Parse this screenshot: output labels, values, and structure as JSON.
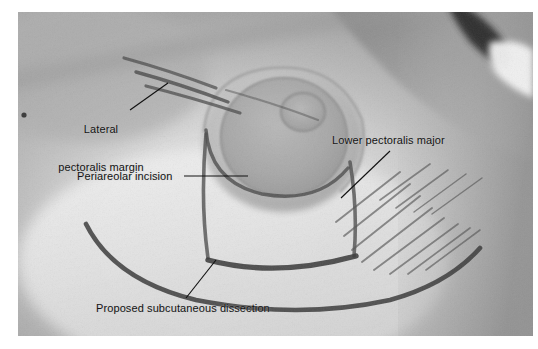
{
  "figure": {
    "type": "clinical-photograph",
    "background_color": "#ffffff",
    "photo": {
      "x": 18,
      "y": 12,
      "width": 515,
      "height": 324,
      "skin_tone": "#b7b7b7",
      "highlight_tone": "#e9e9e9",
      "shadow_tone": "#8a8a8a",
      "marking_color": "#3a3a3a"
    }
  },
  "annotations": [
    {
      "id": "lateral-pectoralis-margin",
      "line1": "Lateral",
      "line2": "pectoralis margin",
      "text": "Lateral pectoralis margin",
      "leader": {
        "x1": 130,
        "y1": 110,
        "x2": 168,
        "y2": 83
      }
    },
    {
      "id": "periareolar-incision",
      "text": "Periareolar incision",
      "leader": {
        "x1": 184,
        "y1": 176,
        "x2": 248,
        "y2": 176
      }
    },
    {
      "id": "lower-pectoralis-major",
      "text": "Lower pectoralis major",
      "leader": {
        "x1": 341,
        "y1": 198,
        "x2": 390,
        "y2": 151
      }
    },
    {
      "id": "proposed-subcutaneous-dissection",
      "text": "Proposed subcutaneous dissection",
      "leader": {
        "x1": 186,
        "y1": 298,
        "x2": 216,
        "y2": 260
      }
    }
  ]
}
